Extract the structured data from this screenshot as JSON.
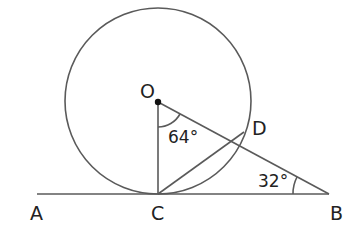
{
  "diagram": {
    "type": "geometry",
    "points": {
      "O": {
        "label": "O"
      },
      "A": {
        "label": "A"
      },
      "B": {
        "label": "B"
      },
      "C": {
        "label": "C"
      },
      "D": {
        "label": "D"
      }
    },
    "angles": {
      "COD": {
        "label": "64°",
        "value": 64
      },
      "OBC": {
        "label": "32°",
        "value": 32
      }
    },
    "segments": [
      "AB",
      "OC",
      "OB",
      "CD"
    ],
    "circle": {
      "center": "O",
      "through": [
        "C",
        "D"
      ]
    }
  }
}
